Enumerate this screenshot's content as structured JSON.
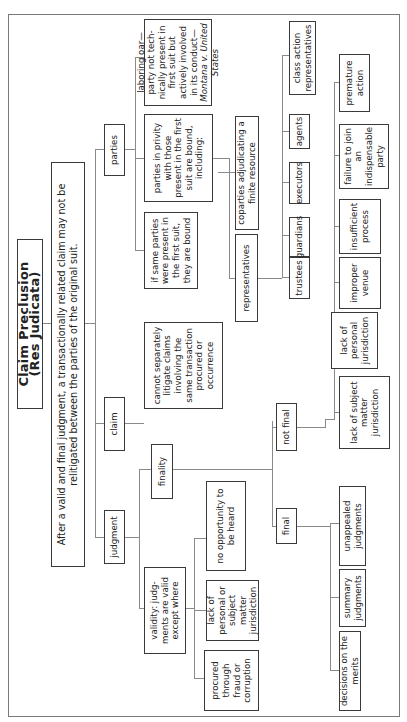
{
  "title": "Claim Preclusion (Res Judicata)",
  "subtitle_line1": "After a valid and final judgment, a transactionally related claim may not be",
  "subtitle_line2": "relitigated between the parties of the original suit.",
  "branches": {
    "judgment": "judgment",
    "claim": "claim",
    "parties": "parties"
  },
  "judgment": {
    "validity": "validity: judg-ments are valid except where",
    "validity_exceptions": [
      "no opportunity to be heard",
      "lack of personal or subject matter jurisdiction",
      "procured through fraud or corruption"
    ],
    "finality": "finality",
    "final": "final",
    "final_items": [
      "decisions on the merits",
      "summary judgments",
      "unappealed judgments"
    ],
    "not_final": "not final",
    "not_final_items": [
      "lack of subject matter jurisdiction",
      "lack of personal jurisdiction",
      "improper venue",
      "insufficient process",
      "failure to join an indispensable party",
      "premature action"
    ]
  },
  "claim": {
    "rule": "cannot separately litigate claims involving the same transaction procured or occurrence"
  },
  "parties": {
    "same_parties": "if same parties were present in the first suit, they are bound",
    "privity": "parties in privity with those present in the first suit are bound, including:",
    "privity_items": {
      "representatives": "representatives",
      "coparties": "coparties adjudicating a finite resource"
    },
    "representative_types": [
      "trustees",
      "guardians",
      "executors",
      "agents",
      "class action representatives"
    ],
    "laboring_oar": "laboring oar—party not tech-nically present in first suit but actively involved in its conduct—",
    "laboring_oar_case": "Montana v. United States"
  }
}
